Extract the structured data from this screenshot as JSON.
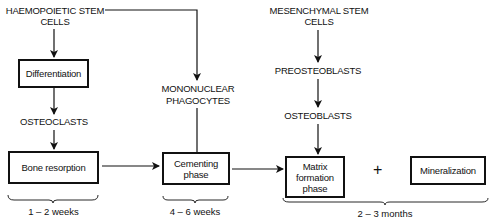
{
  "diagram": {
    "nodes": {
      "haemopoietic": {
        "line1": "HAEMOPOIETIC STEM",
        "line2": "CELLS"
      },
      "differentiation": {
        "label": "Differentiation"
      },
      "osteoclasts": {
        "label": "OSTEOCLASTS"
      },
      "bone_resorption": {
        "label": "Bone resorption"
      },
      "mononuclear": {
        "line1": "MONONUCLEAR",
        "line2": "PHAGOCYTES"
      },
      "cementing": {
        "line1": "Cementing",
        "line2": "phase"
      },
      "mesenchymal": {
        "line1": "MESENCHYMAL STEM",
        "line2": "CELLS"
      },
      "preosteoblasts": {
        "label": "PREOSTEOBLASTS"
      },
      "osteoblasts": {
        "label": "OSTEOBLASTS"
      },
      "matrix": {
        "line1": "Matrix",
        "line2": "formation",
        "line3": "phase"
      },
      "plus": {
        "label": "+"
      },
      "mineralization": {
        "label": "Mineralization"
      }
    },
    "durations": {
      "resorption": "1 – 2 weeks",
      "cementing": "4 – 6 weeks",
      "formation": "2 – 3 months"
    },
    "edges": [
      {
        "from": "haemopoietic",
        "to": "differentiation"
      },
      {
        "from": "differentiation",
        "to": "osteoclasts"
      },
      {
        "from": "osteoclasts",
        "to": "bone_resorption"
      },
      {
        "from": "haemopoietic",
        "to": "mononuclear"
      },
      {
        "from": "mononuclear",
        "to": "cementing"
      },
      {
        "from": "bone_resorption",
        "to": "cementing"
      },
      {
        "from": "cementing",
        "to": "matrix"
      },
      {
        "from": "mesenchymal",
        "to": "preosteoblasts"
      },
      {
        "from": "preosteoblasts",
        "to": "osteoblasts"
      },
      {
        "from": "osteoblasts",
        "to": "matrix"
      }
    ]
  }
}
